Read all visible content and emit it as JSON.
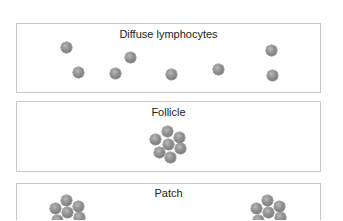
{
  "panels": [
    {
      "title": "Diffuse lymphocytes"
    },
    {
      "title": "Follicle"
    },
    {
      "title": "Patch"
    }
  ],
  "cells": {
    "diffuse": [
      [
        66,
        47
      ],
      [
        78,
        72
      ],
      [
        115,
        73
      ],
      [
        130,
        57
      ],
      [
        171,
        74
      ],
      [
        218,
        69
      ],
      [
        271,
        50
      ],
      [
        272,
        75
      ]
    ],
    "follicle": [
      [
        167,
        131
      ],
      [
        179,
        137
      ],
      [
        180,
        148
      ],
      [
        170,
        157
      ],
      [
        159,
        152
      ],
      [
        155,
        139
      ],
      [
        168,
        144
      ]
    ],
    "patch_left": [
      [
        66,
        200
      ],
      [
        78,
        206
      ],
      [
        79,
        217
      ],
      [
        55,
        208
      ],
      [
        67,
        212
      ],
      [
        57,
        220
      ]
    ],
    "patch_right": [
      [
        267,
        200
      ],
      [
        279,
        206
      ],
      [
        280,
        217
      ],
      [
        256,
        208
      ],
      [
        268,
        212
      ],
      [
        258,
        220
      ]
    ]
  }
}
